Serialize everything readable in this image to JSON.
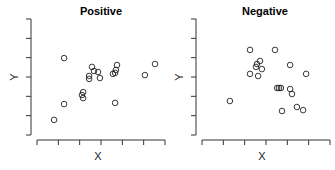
{
  "chart_data": [
    {
      "type": "scatter",
      "title": "Positive",
      "xlabel": "X",
      "ylabel": "Y",
      "xlim": [
        0,
        6
      ],
      "ylim": [
        0,
        6
      ],
      "x_ticks": 7,
      "y_ticks": 7,
      "tick_labels_shown": false,
      "grid": false,
      "points": [
        [
          0.8,
          0.78
        ],
        [
          1.27,
          1.6
        ],
        [
          1.27,
          3.98
        ],
        [
          2.11,
          2.07
        ],
        [
          2.16,
          2.22
        ],
        [
          2.16,
          1.91
        ],
        [
          2.44,
          2.9
        ],
        [
          2.44,
          3.05
        ],
        [
          2.58,
          3.52
        ],
        [
          2.67,
          3.31
        ],
        [
          2.86,
          3.26
        ],
        [
          2.95,
          2.95
        ],
        [
          3.56,
          3.16
        ],
        [
          3.66,
          3.21
        ],
        [
          3.7,
          3.36
        ],
        [
          3.75,
          3.62
        ],
        [
          3.66,
          1.66
        ],
        [
          5.06,
          3.1
        ],
        [
          5.53,
          3.67
        ]
      ]
    },
    {
      "type": "scatter",
      "title": "Negative",
      "xlabel": "X",
      "ylabel": "Y",
      "xlim": [
        0,
        6
      ],
      "ylim": [
        0,
        6
      ],
      "x_ticks": 7,
      "y_ticks": 7,
      "tick_labels_shown": false,
      "grid": false,
      "points": [
        [
          1.31,
          1.76
        ],
        [
          2.25,
          4.4
        ],
        [
          2.25,
          3.16
        ],
        [
          2.53,
          3.52
        ],
        [
          2.58,
          3.67
        ],
        [
          2.63,
          3.05
        ],
        [
          2.72,
          3.83
        ],
        [
          2.81,
          3.41
        ],
        [
          3.42,
          4.4
        ],
        [
          3.52,
          2.43
        ],
        [
          3.61,
          2.43
        ],
        [
          3.7,
          2.43
        ],
        [
          3.75,
          1.24
        ],
        [
          4.13,
          3.62
        ],
        [
          4.13,
          2.38
        ],
        [
          4.22,
          2.12
        ],
        [
          4.45,
          1.45
        ],
        [
          4.74,
          1.29
        ],
        [
          4.88,
          3.16
        ]
      ]
    }
  ],
  "panels": [
    {
      "title": "Positive",
      "xlabel": "X",
      "ylabel": "Y"
    },
    {
      "title": "Negative",
      "xlabel": "X",
      "ylabel": "Y"
    }
  ],
  "colors": {
    "point_stroke": "#222222",
    "axis": "#333333",
    "background": "#ffffff"
  }
}
